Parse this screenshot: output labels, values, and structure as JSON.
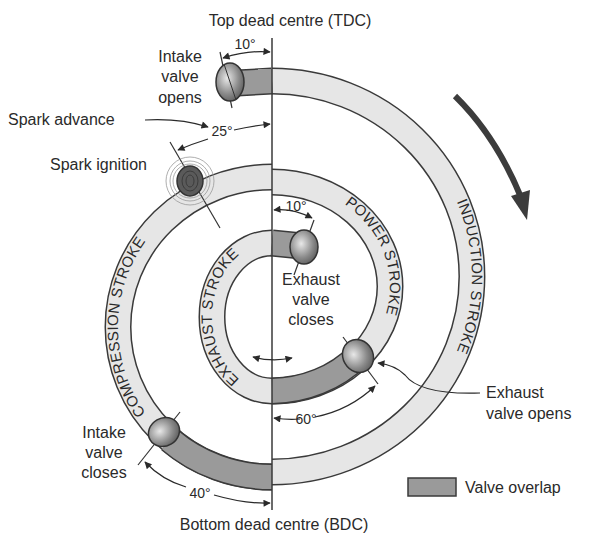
{
  "title_top": "Top dead centre (TDC)",
  "title_bottom": "Bottom dead centre (BDC)",
  "strokes": {
    "induction": "INDUCTION STROKE",
    "compression": "COMPRESSION STROKE",
    "power": "POWER STROKE",
    "exhaust": "EXHAUST STROKE"
  },
  "events": {
    "intake_opens": [
      "Intake",
      "valve",
      "opens"
    ],
    "spark_advance": "Spark advance",
    "spark_ignition": "Spark ignition",
    "exhaust_closes": [
      "Exhaust",
      "valve",
      "closes"
    ],
    "exhaust_opens": [
      "Exhaust",
      "valve opens"
    ],
    "intake_closes": [
      "Intake",
      "valve",
      "closes"
    ]
  },
  "angles": {
    "intake_opens_btdc": "10°",
    "spark_advance": "25°",
    "exhaust_closes_atdc": "10°",
    "exhaust_opens_bbdc": "60°",
    "intake_closes_abdc": "40°"
  },
  "legend": {
    "valve_overlap": "Valve overlap"
  },
  "colors": {
    "band_light": "#e6e6e6",
    "band_overlap": "#9a9a9a",
    "outline": "#3a3a3a",
    "arrow": "#3c3c3c",
    "spark": "#4a4a4a"
  }
}
